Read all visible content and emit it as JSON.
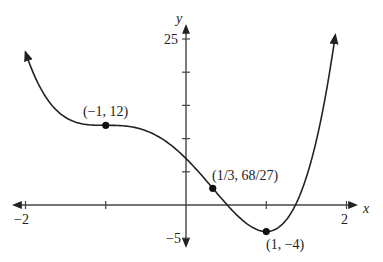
{
  "chart_data": {
    "type": "line",
    "title": "",
    "xlabel": "x",
    "ylabel": "y",
    "xlim": [
      -2,
      2
    ],
    "ylim": [
      -5,
      25
    ],
    "x_ticks": [
      -2,
      -1,
      0,
      1,
      2
    ],
    "x_tick_labels": {
      "-2": "−2",
      "2": "2"
    },
    "y_ticks": [
      -5,
      0,
      5,
      10,
      15,
      20,
      25
    ],
    "y_tick_labels": {
      "25": "25",
      "-5": "−5"
    },
    "grid": false,
    "function": "f(x) = 3x^4 + 4x^3 - 6x^2 - 12x + 7",
    "series": [
      {
        "name": "f(x)",
        "x": [
          -2,
          -1.75,
          -1.5,
          -1.25,
          -1,
          -0.75,
          -0.5,
          -0.25,
          0,
          0.25,
          0.5,
          0.75,
          1,
          1.25,
          1.5,
          1.75,
          1.86
        ],
        "values": [
          23,
          16.2,
          13.2,
          12.2,
          12,
          11.8,
          10.9,
          9.8,
          7,
          3.6,
          0.7,
          -2.2,
          -4,
          -3.2,
          1.3,
          11.9,
          25.5
        ]
      }
    ],
    "annotations": [
      {
        "x": -1,
        "y": 12,
        "label": "(−1, 12)"
      },
      {
        "x": 0.3333,
        "y": 2.5185,
        "label": "(1/3, 68/27)"
      },
      {
        "x": 1,
        "y": -4,
        "label": "(1, −4)"
      }
    ]
  },
  "labels": {
    "x_axis": "x",
    "y_axis": "y",
    "x_min": "−2",
    "x_max": "2",
    "y_max": "25",
    "y_min": "−5",
    "pt1": "(−1, 12)",
    "pt2": "(1/3, 68/27)",
    "pt3": "(1, −4)"
  }
}
